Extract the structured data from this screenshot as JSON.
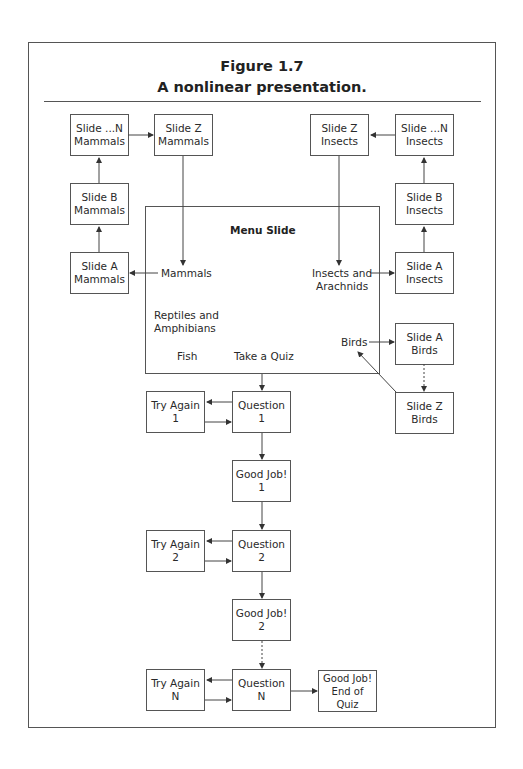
{
  "figure": {
    "number": "Figure 1.7",
    "caption": "A nonlinear presentation."
  },
  "menu": {
    "title": "Menu Slide",
    "items": {
      "mammals": "Mammals",
      "insects": "Insects and\nArachnids",
      "reptiles": "Reptiles and\nAmphibians",
      "birds": "Birds",
      "fish": "Fish",
      "quiz": "Take a Quiz"
    }
  },
  "mammals": {
    "slide_a": "Slide A\nMammals",
    "slide_b": "Slide B\nMammals",
    "slide_n": "Slide ...N\nMammals",
    "slide_z": "Slide Z\nMammals"
  },
  "insects": {
    "slide_a": "Slide A\nInsects",
    "slide_b": "Slide B\nInsects",
    "slide_n": "Slide ...N\nInsects",
    "slide_z": "Slide Z\nInsects"
  },
  "birds": {
    "slide_a": "Slide A\nBirds",
    "slide_z": "Slide Z\nBirds"
  },
  "quiz": {
    "question_1": "Question\n1",
    "try_again_1": "Try Again\n1",
    "good_job_1": "Good Job!\n1",
    "question_2": "Question\n2",
    "try_again_2": "Try Again\n2",
    "good_job_2": "Good Job!\n2",
    "question_n": "Question\nN",
    "try_again_n": "Try Again\nN",
    "good_job_end": "Good Job!\nEnd of Quiz"
  },
  "colors": {
    "line": "#555555",
    "text": "#2a2a2a"
  }
}
